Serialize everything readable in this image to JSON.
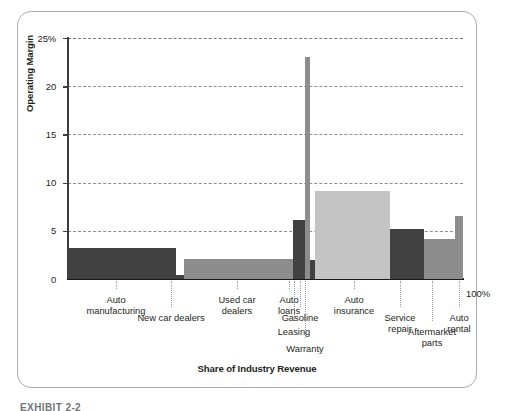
{
  "figure": {
    "caption": "EXHIBIT 2-2",
    "frame": "rounded-rectangle"
  },
  "axis": {
    "ylabel": "Operating Margin",
    "xlabel": "Share of Industry Revenue",
    "yticks": [
      "0",
      "5",
      "10",
      "15",
      "20",
      "25%"
    ],
    "xend_label": "100%"
  },
  "colors": {
    "bar_dark": "#414141",
    "bar_medium": "#8d8d8d",
    "bar_light": "#c4c4c4",
    "axis": "#1a1a1a",
    "grid": "#8a8f94",
    "frame": "#a9adb2",
    "text": "#231f20"
  },
  "chart_data": {
    "type": "bar",
    "title": "",
    "subtitle": "",
    "xlabel": "Share of Industry Revenue",
    "ylabel": "Operating Margin",
    "ylim": [
      0,
      25
    ],
    "yticks": [
      0,
      5,
      10,
      15,
      20,
      25
    ],
    "xlim": [
      0,
      100
    ],
    "grid": "horizontal dashed",
    "legend": "none",
    "note": "Marimekko / variable-width bar chart: bar width = share of industry revenue (%), bar height = operating margin (%)",
    "categories": [
      "Auto manufacturing",
      "New car dealers",
      "Used car dealers",
      "Auto loans",
      "Leasing",
      "Gasoline",
      "Warranty",
      "Auto insurance",
      "Service repair",
      "Aftermarket parts",
      "Auto rental"
    ],
    "values": [
      3.2,
      0.4,
      2.1,
      6.1,
      6.1,
      23.0,
      2.0,
      9.1,
      5.2,
      4.1,
      6.5
    ],
    "widths": [
      25.8,
      1.8,
      26.0,
      1.5,
      1.4,
      1.2,
      1.3,
      17.8,
      8.0,
      7.4,
      2.0
    ],
    "bar_shades": [
      "dark",
      "dark",
      "medium",
      "dark",
      "dark",
      "medium",
      "dark",
      "light",
      "dark",
      "medium",
      "medium"
    ]
  },
  "labels": [
    {
      "text": "Auto\nmanufacturing",
      "id": "auto-manufacturing"
    },
    {
      "text": "New car dealers",
      "id": "new-car-dealers"
    },
    {
      "text": "Used car\ndealers",
      "id": "used-car-dealers"
    },
    {
      "text": "Auto\nloans",
      "id": "auto-loans"
    },
    {
      "text": "Leasing",
      "id": "leasing"
    },
    {
      "text": "Gasoline",
      "id": "gasoline"
    },
    {
      "text": "Warranty",
      "id": "warranty"
    },
    {
      "text": "Auto\ninsurance",
      "id": "auto-insurance"
    },
    {
      "text": "Service\nrepair",
      "id": "service-repair"
    },
    {
      "text": "Aftermarket\nparts",
      "id": "aftermarket-parts"
    },
    {
      "text": "Auto\nrental",
      "id": "auto-rental"
    }
  ]
}
